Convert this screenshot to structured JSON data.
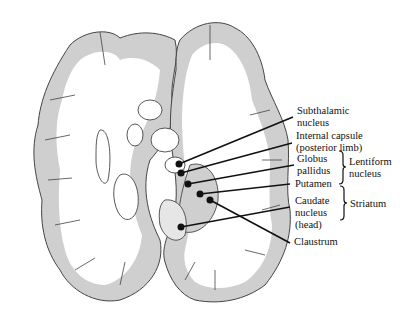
{
  "diagram": {
    "labels": {
      "subthalamic": "Subthalamic\nnucleus",
      "internal_capsule": "Internal capsule\n(posterior limb)",
      "globus_pallidus": "Globus\npallidus",
      "putamen": "Putamen",
      "caudate": "Caudate\nnucleus\n(head)",
      "claustrum": "Claustrum"
    },
    "groups": {
      "lentiform": "Lentiform\nnucleus",
      "striatum": "Striatum"
    },
    "colors": {
      "cortex_gray": "#cfcfcf",
      "white_matter": "#ffffff",
      "outline": "#444444",
      "leader_line": "#111111"
    }
  }
}
